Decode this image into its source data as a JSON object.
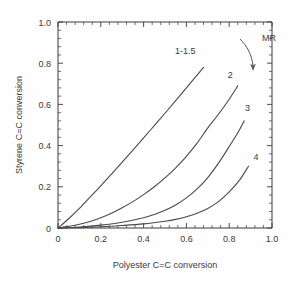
{
  "chart_data": {
    "type": "line",
    "title": "",
    "subtitle": "",
    "xlabel": "Polyester C=C conversion",
    "ylabel": "Styrene C=C conversion",
    "xlim": [
      0,
      1.0
    ],
    "ylim": [
      0,
      1.0
    ],
    "xticks": [
      "0",
      "0.2",
      "0.4",
      "0.6",
      "0.8",
      "1.0"
    ],
    "xtick_values": [
      0,
      0.2,
      0.4,
      0.6,
      0.8,
      1.0
    ],
    "yticks": [
      "0",
      "0.2",
      "0.4",
      "0.6",
      "0.8",
      "1.0"
    ],
    "ytick_values": [
      0,
      0.2,
      0.4,
      0.6,
      0.8,
      1.0
    ],
    "minor_ticks_per_interval": 4,
    "grid": false,
    "legend_position": "inline-curve-labels",
    "annotation": {
      "text": "MR",
      "meaning": "molar ratio increases in arrow direction",
      "arrow": "curved-down-right"
    },
    "series": [
      {
        "name": "1-1.5",
        "label": "1-1.5",
        "label_x": 0.595,
        "label_y": 0.845,
        "points": [
          {
            "x": 0.0,
            "y": 0.0
          },
          {
            "x": 0.05,
            "y": 0.045
          },
          {
            "x": 0.1,
            "y": 0.095
          },
          {
            "x": 0.15,
            "y": 0.15
          },
          {
            "x": 0.2,
            "y": 0.205
          },
          {
            "x": 0.25,
            "y": 0.262
          },
          {
            "x": 0.3,
            "y": 0.32
          },
          {
            "x": 0.35,
            "y": 0.378
          },
          {
            "x": 0.4,
            "y": 0.437
          },
          {
            "x": 0.45,
            "y": 0.497
          },
          {
            "x": 0.5,
            "y": 0.557
          },
          {
            "x": 0.55,
            "y": 0.618
          },
          {
            "x": 0.6,
            "y": 0.68
          },
          {
            "x": 0.64,
            "y": 0.73
          },
          {
            "x": 0.68,
            "y": 0.78
          }
        ]
      },
      {
        "name": "2",
        "label": "2",
        "label_x": 0.805,
        "label_y": 0.73,
        "points": [
          {
            "x": 0.0,
            "y": 0.0
          },
          {
            "x": 0.05,
            "y": 0.008
          },
          {
            "x": 0.1,
            "y": 0.018
          },
          {
            "x": 0.15,
            "y": 0.032
          },
          {
            "x": 0.2,
            "y": 0.05
          },
          {
            "x": 0.25,
            "y": 0.072
          },
          {
            "x": 0.3,
            "y": 0.098
          },
          {
            "x": 0.35,
            "y": 0.128
          },
          {
            "x": 0.4,
            "y": 0.162
          },
          {
            "x": 0.45,
            "y": 0.2
          },
          {
            "x": 0.5,
            "y": 0.243
          },
          {
            "x": 0.55,
            "y": 0.292
          },
          {
            "x": 0.6,
            "y": 0.348
          },
          {
            "x": 0.65,
            "y": 0.412
          },
          {
            "x": 0.7,
            "y": 0.486
          },
          {
            "x": 0.75,
            "y": 0.552
          },
          {
            "x": 0.8,
            "y": 0.625
          },
          {
            "x": 0.84,
            "y": 0.69
          }
        ]
      },
      {
        "name": "3",
        "label": "3",
        "label_x": 0.885,
        "label_y": 0.57,
        "points": [
          {
            "x": 0.0,
            "y": 0.0
          },
          {
            "x": 0.1,
            "y": 0.005
          },
          {
            "x": 0.2,
            "y": 0.014
          },
          {
            "x": 0.3,
            "y": 0.028
          },
          {
            "x": 0.4,
            "y": 0.05
          },
          {
            "x": 0.45,
            "y": 0.066
          },
          {
            "x": 0.5,
            "y": 0.086
          },
          {
            "x": 0.55,
            "y": 0.112
          },
          {
            "x": 0.6,
            "y": 0.146
          },
          {
            "x": 0.65,
            "y": 0.19
          },
          {
            "x": 0.7,
            "y": 0.245
          },
          {
            "x": 0.75,
            "y": 0.315
          },
          {
            "x": 0.8,
            "y": 0.395
          },
          {
            "x": 0.84,
            "y": 0.462
          },
          {
            "x": 0.87,
            "y": 0.52
          }
        ]
      },
      {
        "name": "4",
        "label": "4",
        "label_x": 0.925,
        "label_y": 0.33,
        "points": [
          {
            "x": 0.0,
            "y": 0.0
          },
          {
            "x": 0.1,
            "y": 0.002
          },
          {
            "x": 0.2,
            "y": 0.006
          },
          {
            "x": 0.3,
            "y": 0.012
          },
          {
            "x": 0.4,
            "y": 0.02
          },
          {
            "x": 0.5,
            "y": 0.033
          },
          {
            "x": 0.55,
            "y": 0.042
          },
          {
            "x": 0.6,
            "y": 0.055
          },
          {
            "x": 0.65,
            "y": 0.072
          },
          {
            "x": 0.7,
            "y": 0.095
          },
          {
            "x": 0.75,
            "y": 0.128
          },
          {
            "x": 0.8,
            "y": 0.175
          },
          {
            "x": 0.85,
            "y": 0.235
          },
          {
            "x": 0.89,
            "y": 0.3
          }
        ]
      }
    ]
  },
  "colors": {
    "background": "#fefefe",
    "axis": "#3a3a3a",
    "curve": "#4a4a4a",
    "text": "#3a3a3a"
  }
}
